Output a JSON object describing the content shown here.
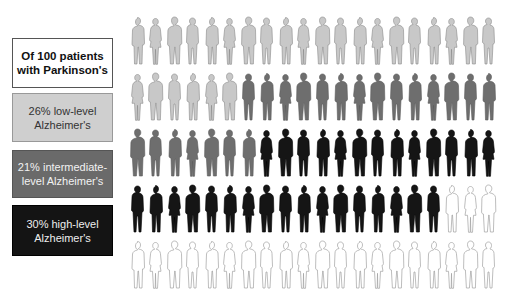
{
  "legend": {
    "title": {
      "line1": "Of 100 patients",
      "line2": "with Parkinson's"
    },
    "low": {
      "line1": "26% low-level",
      "line2": "Alzheimer's",
      "fill": "#cfcfcf"
    },
    "mid": {
      "line1": "21% intermediate-",
      "line2": "level Alzheimer's",
      "fill": "#6a6a6a"
    },
    "high": {
      "line1": "30% high-level",
      "line2": "Alzheimer's",
      "fill": "#141414"
    }
  },
  "colors": {
    "low": {
      "fill": "#c8c8c8",
      "stroke": "#8a8a8a"
    },
    "mid": {
      "fill": "#6e6e6e",
      "stroke": "#5a5a5a"
    },
    "high": {
      "fill": "#151515",
      "stroke": "#000000"
    },
    "none": {
      "fill": "#ffffff",
      "stroke": "#a0a0a0"
    }
  },
  "chart_data": {
    "type": "pictogram",
    "title": "Of 100 patients with Parkinson's",
    "total": 100,
    "rows": 5,
    "columns": 20,
    "categories": [
      "low-level Alzheimer's",
      "intermediate-level Alzheimer's",
      "high-level Alzheimer's",
      "no Alzheimer's (unlabeled)"
    ],
    "values": [
      26,
      21,
      30,
      23
    ],
    "legend_labels": [
      "26% low-level Alzheimer's",
      "21% intermediate-level Alzheimer's",
      "30% high-level Alzheimer's"
    ],
    "row_composition": [
      {
        "row": 1,
        "low": 20,
        "mid": 0,
        "high": 0,
        "none": 0
      },
      {
        "row": 2,
        "low": 6,
        "mid": 14,
        "high": 0,
        "none": 0
      },
      {
        "row": 3,
        "low": 0,
        "mid": 7,
        "high": 13,
        "none": 0
      },
      {
        "row": 4,
        "low": 0,
        "mid": 0,
        "high": 17,
        "none": 3
      },
      {
        "row": 5,
        "low": 0,
        "mid": 0,
        "high": 0,
        "none": 20
      }
    ],
    "legend_position": "left"
  }
}
